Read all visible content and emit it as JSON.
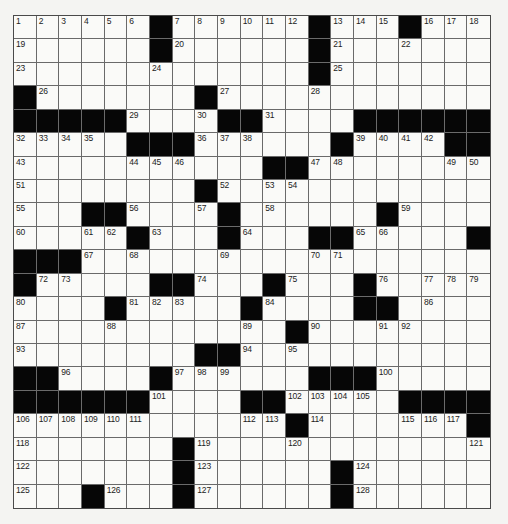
{
  "puzzle": {
    "rows": 21,
    "cols": 21,
    "pattern": [
      "......#......#...#...",
      "......#......#.......",
      ".............#.......",
      "#.......#............",
      "#####....##....######",
      ".....###......#....##",
      "...........##........",
      "........#............",
      "...##....#......#....",
      ".....#...#...##.....#",
      "###..................###",
      "#.....##...#...#.....",
      "....#.....#....##....",
      "............#........",
      "........##...........",
      "##....#......###.....",
      "######....##.....####",
      "............#.......#",
      ".......#.............",
      ".......#......#......",
      "...#...#......#......"
    ],
    "numbers": [
      [
        1,
        2,
        3,
        4,
        5,
        6,
        0,
        7,
        8,
        9,
        10,
        11,
        12,
        0,
        13,
        14,
        15,
        0,
        16,
        17,
        18
      ],
      [
        19,
        0,
        0,
        0,
        0,
        0,
        0,
        20,
        0,
        0,
        0,
        0,
        0,
        0,
        21,
        0,
        0,
        22,
        0,
        0,
        0
      ],
      [
        23,
        0,
        0,
        0,
        0,
        0,
        24,
        0,
        0,
        0,
        0,
        0,
        0,
        0,
        25,
        0,
        0,
        0,
        0,
        0,
        0
      ],
      [
        0,
        26,
        0,
        0,
        0,
        0,
        0,
        0,
        0,
        27,
        0,
        0,
        0,
        28,
        0,
        0,
        0,
        0,
        0,
        0,
        0
      ],
      [
        0,
        0,
        0,
        0,
        0,
        29,
        0,
        0,
        30,
        0,
        0,
        31,
        0,
        0,
        0,
        0,
        0,
        0,
        0,
        0,
        0
      ],
      [
        32,
        33,
        34,
        35,
        0,
        0,
        0,
        0,
        36,
        37,
        38,
        0,
        0,
        0,
        0,
        39,
        40,
        41,
        42,
        0,
        0
      ],
      [
        43,
        0,
        0,
        0,
        0,
        44,
        45,
        46,
        0,
        0,
        0,
        0,
        0,
        47,
        48,
        0,
        0,
        0,
        0,
        49,
        50
      ],
      [
        51,
        0,
        0,
        0,
        0,
        0,
        0,
        0,
        0,
        52,
        0,
        53,
        54,
        0,
        0,
        0,
        0,
        0,
        0,
        0,
        0
      ],
      [
        55,
        0,
        0,
        0,
        0,
        56,
        0,
        0,
        57,
        0,
        0,
        58,
        0,
        0,
        0,
        0,
        0,
        59,
        0,
        0,
        0
      ],
      [
        60,
        0,
        0,
        61,
        62,
        0,
        63,
        0,
        0,
        0,
        64,
        0,
        0,
        0,
        0,
        65,
        66,
        0,
        0,
        0,
        0
      ],
      [
        0,
        0,
        0,
        67,
        0,
        68,
        0,
        0,
        0,
        69,
        0,
        0,
        0,
        70,
        71,
        0,
        0,
        0,
        0,
        0,
        0
      ],
      [
        0,
        72,
        73,
        0,
        0,
        0,
        0,
        0,
        74,
        0,
        0,
        0,
        75,
        0,
        0,
        0,
        76,
        0,
        77,
        78,
        79
      ],
      [
        80,
        0,
        0,
        0,
        0,
        81,
        82,
        83,
        0,
        0,
        0,
        84,
        0,
        0,
        0,
        85,
        0,
        0,
        86,
        0,
        0
      ],
      [
        87,
        0,
        0,
        0,
        88,
        0,
        0,
        0,
        0,
        0,
        89,
        0,
        0,
        90,
        0,
        0,
        91,
        92,
        0,
        0,
        0
      ],
      [
        93,
        0,
        0,
        0,
        0,
        0,
        0,
        0,
        0,
        0,
        94,
        0,
        95,
        0,
        0,
        0,
        0,
        0,
        0,
        0,
        0
      ],
      [
        0,
        0,
        96,
        0,
        0,
        0,
        0,
        97,
        98,
        99,
        0,
        0,
        0,
        0,
        0,
        0,
        100,
        0,
        0,
        0,
        0
      ],
      [
        0,
        0,
        0,
        0,
        0,
        0,
        101,
        0,
        0,
        0,
        0,
        0,
        102,
        103,
        104,
        105,
        0,
        0,
        0,
        0,
        0
      ],
      [
        106,
        107,
        108,
        109,
        110,
        111,
        0,
        0,
        0,
        0,
        112,
        113,
        0,
        114,
        0,
        0,
        0,
        115,
        116,
        117,
        0
      ],
      [
        118,
        0,
        0,
        0,
        0,
        0,
        0,
        0,
        119,
        0,
        0,
        0,
        120,
        0,
        0,
        0,
        0,
        0,
        0,
        0,
        121
      ],
      [
        122,
        0,
        0,
        0,
        0,
        0,
        0,
        0,
        123,
        0,
        0,
        0,
        0,
        0,
        0,
        124,
        0,
        0,
        0,
        0,
        0
      ],
      [
        125,
        0,
        0,
        0,
        126,
        0,
        0,
        0,
        127,
        0,
        0,
        0,
        0,
        0,
        0,
        128,
        0,
        0,
        0,
        0,
        0
      ]
    ]
  }
}
